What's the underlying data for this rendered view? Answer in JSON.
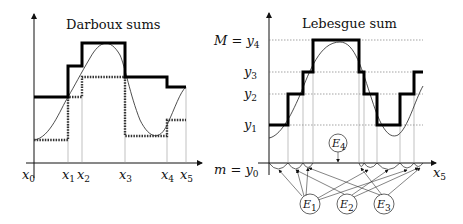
{
  "left_panel": {
    "title": "Darboux sums",
    "x_labels": [
      {
        "base": "x",
        "sub": "0"
      },
      {
        "base": "x",
        "sub": "1"
      },
      {
        "base": "x",
        "sub": "2"
      },
      {
        "base": "x",
        "sub": "3"
      },
      {
        "base": "x",
        "sub": "4"
      },
      {
        "base": "x",
        "sub": "5"
      }
    ]
  },
  "right_panel": {
    "title": "Lebesgue sum",
    "y_labels": [
      {
        "text": "M = y",
        "sub": "4"
      },
      {
        "text": "y",
        "sub": "3"
      },
      {
        "text": "y",
        "sub": "2"
      },
      {
        "text": "y",
        "sub": "1"
      },
      {
        "text": "m = y",
        "sub": "0"
      }
    ],
    "x_label": {
      "base": "x",
      "sub": "5"
    },
    "sets": [
      {
        "base": "E",
        "sub": "1"
      },
      {
        "base": "E",
        "sub": "2"
      },
      {
        "base": "E",
        "sub": "3"
      },
      {
        "base": "E",
        "sub": "4"
      }
    ]
  }
}
